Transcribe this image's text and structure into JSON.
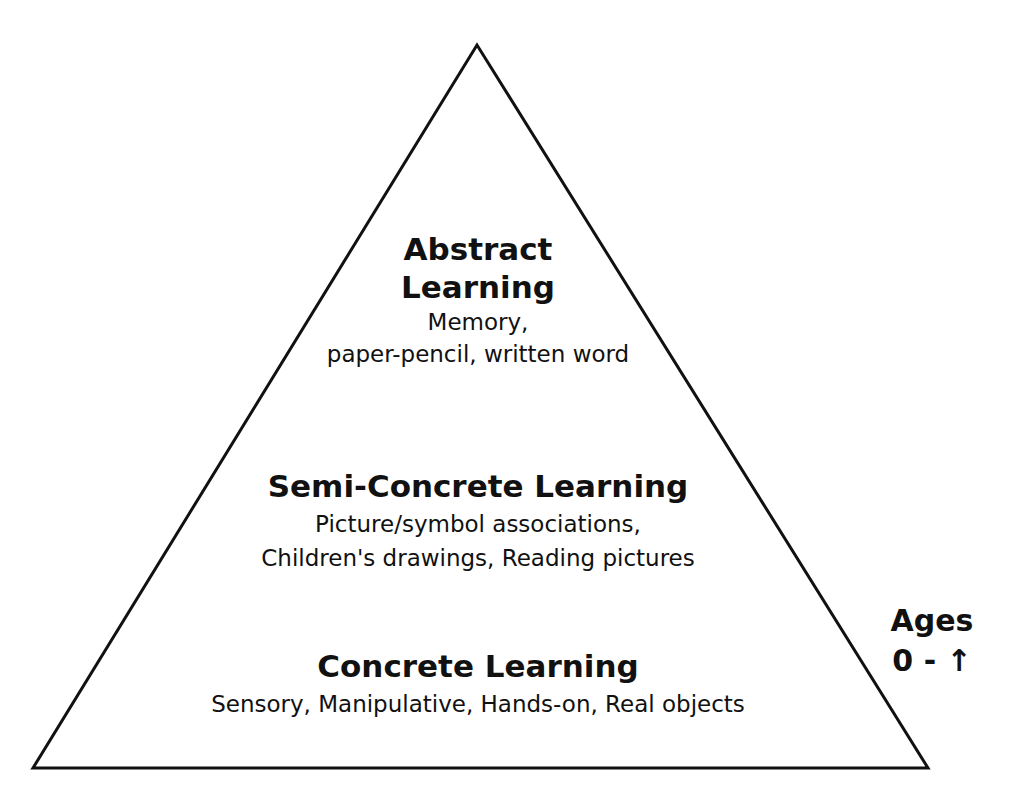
{
  "diagram": {
    "type": "pyramid",
    "levels": [
      {
        "title": "Abstract",
        "title_line2": "Learning",
        "desc_line1": "Memory,",
        "desc_line2": "paper-pencil, written word"
      },
      {
        "title": "Semi-Concrete Learning",
        "desc_line1": "Picture/symbol associations,",
        "desc_line2": "Children's drawings, Reading pictures"
      },
      {
        "title": "Concrete Learning",
        "desc_line1": "Sensory, Manipulative, Hands-on, Real objects"
      }
    ],
    "side_label": {
      "line1": "Ages",
      "line2": "0 - ↑"
    },
    "colors": {
      "stroke": "#111111",
      "background": "#ffffff"
    }
  }
}
